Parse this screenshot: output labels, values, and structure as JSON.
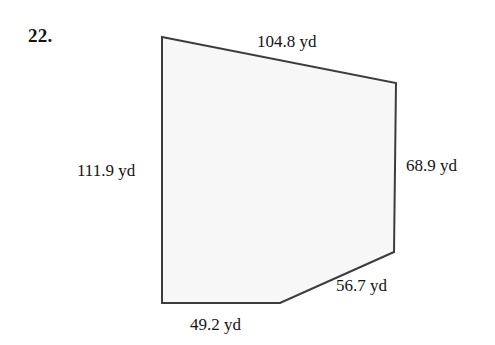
{
  "problem": {
    "number": "22."
  },
  "figure": {
    "shape_name": "pentagon-lot",
    "fill_color": "#f7f7f7",
    "stroke_color": "#3c3c3c",
    "stroke_width": 2,
    "background_color": "#ffffff",
    "vertices": [
      [
        162,
        37
      ],
      [
        396,
        83
      ],
      [
        394,
        252
      ],
      [
        280,
        303
      ],
      [
        162,
        303
      ]
    ],
    "points_attr": "162,37 396,83 394,252 280,303 162,303"
  },
  "labels": {
    "top": "104.8 yd",
    "left": "111.9 yd",
    "right": "68.9 yd",
    "slant": "56.7 yd",
    "bottom": "49.2 yd"
  },
  "measurements": [
    {
      "side": "top",
      "value": 104.8,
      "unit": "yd",
      "text": "104.8 yd"
    },
    {
      "side": "left",
      "value": 111.9,
      "unit": "yd",
      "text": "111.9 yd"
    },
    {
      "side": "right",
      "value": 68.9,
      "unit": "yd",
      "text": "68.9 yd"
    },
    {
      "side": "bottom-right",
      "value": 56.7,
      "unit": "yd",
      "text": "56.7 yd"
    },
    {
      "side": "bottom",
      "value": 49.2,
      "unit": "yd",
      "text": "49.2 yd"
    }
  ]
}
